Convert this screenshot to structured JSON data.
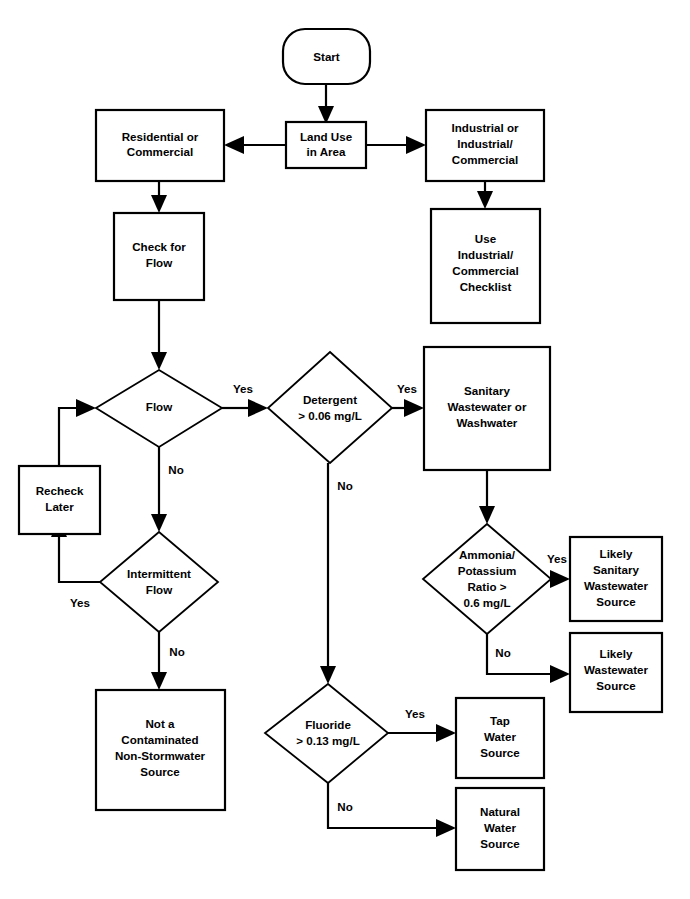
{
  "diagram": {
    "background_color": "#ffffff",
    "line_color": "#000000",
    "text_color": "#000000",
    "nodes": {
      "start": {
        "label": "Start",
        "shape": "terminator"
      },
      "land_use": {
        "label_lines": [
          "Land Use",
          "in Area"
        ],
        "shape": "process"
      },
      "residential": {
        "label_lines": [
          "Residential or",
          "Commercial"
        ],
        "shape": "process"
      },
      "industrial": {
        "label_lines": [
          "Industrial or",
          "Industrial/",
          "Commercial"
        ],
        "shape": "process"
      },
      "use_checklist": {
        "label_lines": [
          "Use",
          "Industrial/",
          "Commercial",
          "Checklist"
        ],
        "shape": "process"
      },
      "check_flow": {
        "label_lines": [
          "Check for",
          "Flow"
        ],
        "shape": "process"
      },
      "flow": {
        "label_lines": [
          "Flow"
        ],
        "shape": "decision"
      },
      "recheck_later": {
        "label_lines": [
          "Recheck",
          "Later"
        ],
        "shape": "process"
      },
      "intermittent_flow": {
        "label_lines": [
          "Intermittent",
          "Flow"
        ],
        "shape": "decision"
      },
      "not_contaminated": {
        "label_lines": [
          "Not a",
          "Contaminated",
          "Non-Stormwater",
          "Source"
        ],
        "shape": "process"
      },
      "detergent": {
        "label_lines": [
          "Detergent",
          "> 0.06 mg/L"
        ],
        "shape": "decision"
      },
      "sanitary_or_wash": {
        "label_lines": [
          "Sanitary",
          "Wastewater or",
          "Washwater"
        ],
        "shape": "process"
      },
      "ammonia_ratio": {
        "label_lines": [
          "Ammonia/",
          "Potassium",
          "Ratio >",
          "0.6 mg/L"
        ],
        "shape": "decision"
      },
      "likely_sanitary": {
        "label_lines": [
          "Likely",
          "Sanitary",
          "Wastewater",
          "Source"
        ],
        "shape": "process"
      },
      "likely_wastewater": {
        "label_lines": [
          "Likely",
          "Wastewater",
          "Source"
        ],
        "shape": "process"
      },
      "fluoride": {
        "label_lines": [
          "Fluoride",
          "> 0.13 mg/L"
        ],
        "shape": "decision"
      },
      "tap_water": {
        "label_lines": [
          "Tap",
          "Water",
          "Source"
        ],
        "shape": "process"
      },
      "natural_water": {
        "label_lines": [
          "Natural",
          "Water",
          "Source"
        ],
        "shape": "process"
      }
    },
    "edge_labels": {
      "flow_yes": "Yes",
      "flow_no": "No",
      "intermittent_yes": "Yes",
      "intermittent_no": "No",
      "detergent_yes": "Yes",
      "detergent_no": "No",
      "ammonia_yes": "Yes",
      "ammonia_no": "No",
      "fluoride_yes": "Yes",
      "fluoride_no": "No"
    },
    "edges": [
      {
        "from": "start",
        "to": "land_use",
        "label": ""
      },
      {
        "from": "land_use",
        "to": "residential",
        "label": ""
      },
      {
        "from": "land_use",
        "to": "industrial",
        "label": ""
      },
      {
        "from": "industrial",
        "to": "use_checklist",
        "label": ""
      },
      {
        "from": "residential",
        "to": "check_flow",
        "label": ""
      },
      {
        "from": "check_flow",
        "to": "flow",
        "label": ""
      },
      {
        "from": "flow",
        "to": "detergent",
        "label": "Yes"
      },
      {
        "from": "flow",
        "to": "intermittent_flow",
        "label": "No"
      },
      {
        "from": "intermittent_flow",
        "to": "recheck_later",
        "label": "Yes"
      },
      {
        "from": "recheck_later",
        "to": "flow",
        "label": ""
      },
      {
        "from": "intermittent_flow",
        "to": "not_contaminated",
        "label": "No"
      },
      {
        "from": "detergent",
        "to": "sanitary_or_wash",
        "label": "Yes"
      },
      {
        "from": "detergent",
        "to": "fluoride",
        "label": "No"
      },
      {
        "from": "sanitary_or_wash",
        "to": "ammonia_ratio",
        "label": ""
      },
      {
        "from": "ammonia_ratio",
        "to": "likely_sanitary",
        "label": "Yes"
      },
      {
        "from": "ammonia_ratio",
        "to": "likely_wastewater",
        "label": "No"
      },
      {
        "from": "fluoride",
        "to": "tap_water",
        "label": "Yes"
      },
      {
        "from": "fluoride",
        "to": "natural_water",
        "label": "No"
      }
    ]
  }
}
